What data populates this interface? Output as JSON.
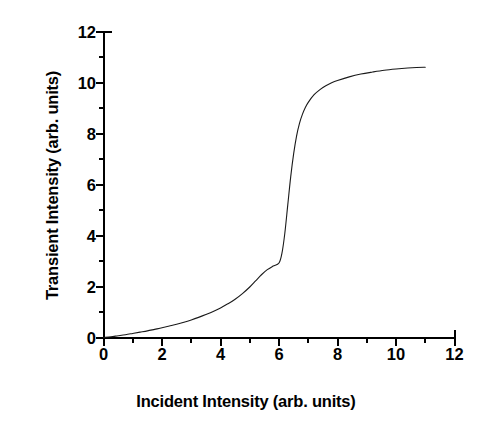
{
  "chart_data": {
    "type": "line",
    "title": "",
    "xlabel": "Incident Intensity (arb. units)",
    "ylabel": "Transient Intensity (arb. units)",
    "xlim": [
      0,
      12
    ],
    "ylim": [
      0,
      12
    ],
    "xticks": [
      0,
      2,
      4,
      6,
      8,
      10,
      12
    ],
    "xtick_labels": [
      "0",
      "2",
      "4",
      "6",
      "8",
      "10",
      "12"
    ],
    "xminor_ticks": [
      1,
      3,
      5,
      7,
      9,
      11
    ],
    "yticks": [
      0,
      2,
      4,
      6,
      8,
      10,
      12
    ],
    "ytick_labels": [
      "0",
      "2",
      "4",
      "6",
      "8",
      "10",
      "12"
    ],
    "yminor_ticks": [
      1,
      3,
      5,
      7,
      9,
      11
    ],
    "grid": false,
    "legend": false,
    "tick_direction": "out",
    "spines": [
      "left",
      "bottom"
    ],
    "line_color": "#1a1a1a",
    "line_width": 1.1,
    "series": [
      {
        "name": "transient response",
        "x": [
          0.0,
          0.25,
          0.5,
          0.75,
          1.0,
          1.25,
          1.5,
          1.75,
          2.0,
          2.25,
          2.5,
          2.75,
          3.0,
          3.25,
          3.5,
          3.75,
          4.0,
          4.25,
          4.5,
          4.75,
          5.0,
          5.2,
          5.4,
          5.6,
          5.8,
          6.0,
          6.1,
          6.2,
          6.3,
          6.4,
          6.5,
          6.6,
          6.7,
          6.8,
          6.9,
          7.0,
          7.2,
          7.4,
          7.6,
          7.8,
          8.0,
          8.4,
          8.8,
          9.2,
          9.6,
          10.0,
          10.4,
          10.7,
          11.0
        ],
        "y": [
          0.0,
          0.03,
          0.07,
          0.11,
          0.16,
          0.21,
          0.26,
          0.32,
          0.38,
          0.45,
          0.52,
          0.6,
          0.69,
          0.79,
          0.9,
          1.02,
          1.16,
          1.32,
          1.5,
          1.72,
          1.98,
          2.22,
          2.46,
          2.66,
          2.8,
          2.92,
          3.3,
          4.1,
          5.2,
          6.3,
          7.2,
          7.9,
          8.4,
          8.75,
          9.02,
          9.22,
          9.52,
          9.72,
          9.87,
          9.99,
          10.08,
          10.22,
          10.33,
          10.41,
          10.48,
          10.53,
          10.57,
          10.59,
          10.6
        ]
      }
    ]
  }
}
